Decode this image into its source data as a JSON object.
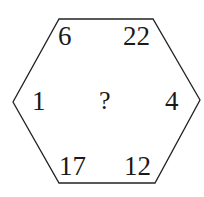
{
  "puzzle": {
    "shape": "hexagon",
    "stroke_color": "#222222",
    "text_color": "#1a1a1a",
    "vertices": [
      [
        59,
        19
      ],
      [
        153,
        19
      ],
      [
        200,
        100
      ],
      [
        155,
        183
      ],
      [
        59,
        183
      ],
      [
        13,
        102
      ]
    ],
    "numbers": {
      "top_left": "6",
      "top_right": "22",
      "middle_left": "1",
      "middle_right": "4",
      "bottom_left": "17",
      "bottom_right": "12"
    },
    "center": "?"
  }
}
